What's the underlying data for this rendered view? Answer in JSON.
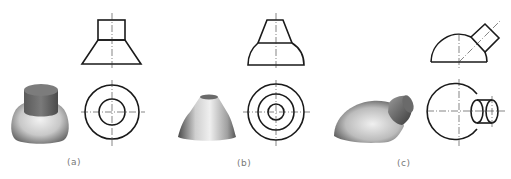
{
  "figure": {
    "panels": [
      {
        "id": "a",
        "label": "(a)",
        "description": "Cylinder on top of truncated cone",
        "render_3d": {
          "shape": "cylinder-on-frustum",
          "top_color": "#6e6e6e",
          "body_color": "#bdbdbd"
        },
        "front_view": {
          "shape": "rectangle-over-trapezoid"
        },
        "top_view": {
          "shape": "two-concentric-circles",
          "circles": 2
        }
      },
      {
        "id": "b",
        "label": "(b)",
        "description": "Truncated cone on top of curved frustum",
        "render_3d": {
          "shape": "cone-on-curved-frustum",
          "body_color": "#bdbdbd"
        },
        "front_view": {
          "shape": "trapezoid-over-curved-trapezoid"
        },
        "top_view": {
          "shape": "three-concentric-circles",
          "circles": 3
        }
      },
      {
        "id": "c",
        "label": "(c)",
        "description": "Hemisphere with inclined cylinder",
        "render_3d": {
          "shape": "hemisphere-with-oblique-cylinder",
          "body_color": "#b0b0b0"
        },
        "front_view": {
          "shape": "semicircle-with-tilted-rectangle",
          "cylinder_angle_deg": 45
        },
        "top_view": {
          "shape": "circle-with-side-cylinder"
        }
      }
    ],
    "colors": {
      "line": "#1a1a1a",
      "centerline": "#333333",
      "label": "#777777",
      "background": "#ffffff"
    }
  }
}
